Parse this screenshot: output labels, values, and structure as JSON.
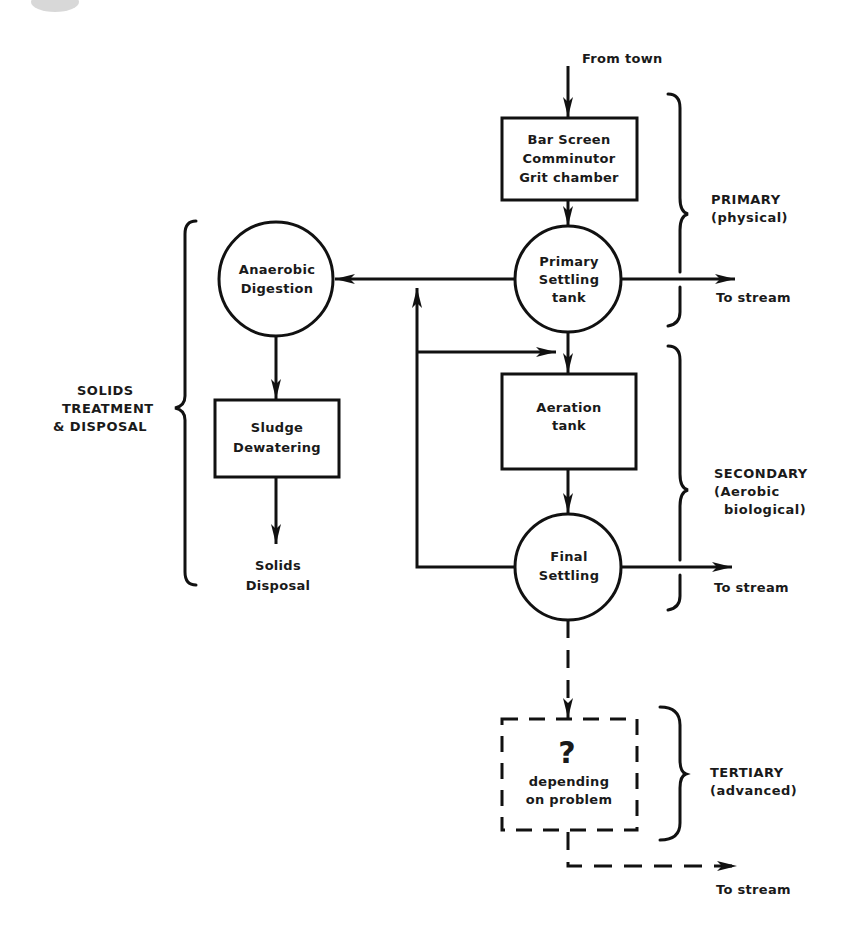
{
  "diagram": {
    "type": "flowchart",
    "input_label": "From town",
    "nodes": {
      "bar_screen": {
        "shape": "box",
        "lines": [
          "Bar Screen",
          "Comminutor",
          "Grit chamber"
        ]
      },
      "primary_settling": {
        "shape": "circle",
        "lines": [
          "Primary",
          "Settling",
          "tank"
        ]
      },
      "anaerobic_digestion": {
        "shape": "circle",
        "lines": [
          "Anaerobic",
          "Digestion"
        ]
      },
      "sludge_dewatering": {
        "shape": "box",
        "lines": [
          "Sludge",
          "Dewatering"
        ]
      },
      "solids_disposal": {
        "shape": "text",
        "lines": [
          "Solids",
          "Disposal"
        ]
      },
      "aeration_tank": {
        "shape": "box",
        "lines": [
          "Aeration",
          "tank"
        ]
      },
      "final_settling": {
        "shape": "circle",
        "lines": [
          "Final",
          "Settling"
        ]
      },
      "tertiary_unit": {
        "shape": "dashed-box",
        "symbol": "?",
        "lines": [
          "depending",
          "on problem"
        ]
      }
    },
    "outputs": {
      "primary_out": "To stream",
      "secondary_out": "To stream",
      "tertiary_out": "To stream"
    },
    "stages": {
      "primary": [
        "PRIMARY",
        "(physical)"
      ],
      "secondary": [
        "SECONDARY",
        "(Aerobic",
        "biological)"
      ],
      "tertiary": [
        "TERTIARY",
        "(advanced)"
      ],
      "solids": [
        "SOLIDS",
        "TREATMENT",
        "& DISPOSAL"
      ]
    },
    "edges": [
      {
        "from": "From town",
        "to": "bar_screen"
      },
      {
        "from": "bar_screen",
        "to": "primary_settling"
      },
      {
        "from": "primary_settling",
        "to": "anaerobic_digestion"
      },
      {
        "from": "primary_settling",
        "to": "To stream"
      },
      {
        "from": "primary_settling",
        "to": "aeration_tank"
      },
      {
        "from": "anaerobic_digestion",
        "to": "sludge_dewatering"
      },
      {
        "from": "sludge_dewatering",
        "to": "solids_disposal"
      },
      {
        "from": "aeration_tank",
        "to": "final_settling"
      },
      {
        "from": "final_settling",
        "to": "To stream"
      },
      {
        "from": "final_settling",
        "to": "aeration_tank",
        "label": "return sludge loop"
      },
      {
        "from": "final_settling",
        "to": "anaerobic_digestion",
        "label": "waste sludge loop"
      },
      {
        "from": "final_settling",
        "to": "tertiary_unit",
        "style": "dashed"
      },
      {
        "from": "tertiary_unit",
        "to": "To stream",
        "style": "dashed"
      }
    ]
  }
}
